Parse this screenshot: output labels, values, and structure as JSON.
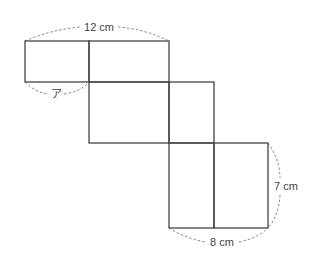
{
  "diagram": {
    "type": "cube-net",
    "labels": {
      "top_width": "12 cm",
      "unknown": "ア",
      "right_height": "7 cm",
      "bottom_width": "8 cm"
    },
    "line_color": "#444444"
  }
}
